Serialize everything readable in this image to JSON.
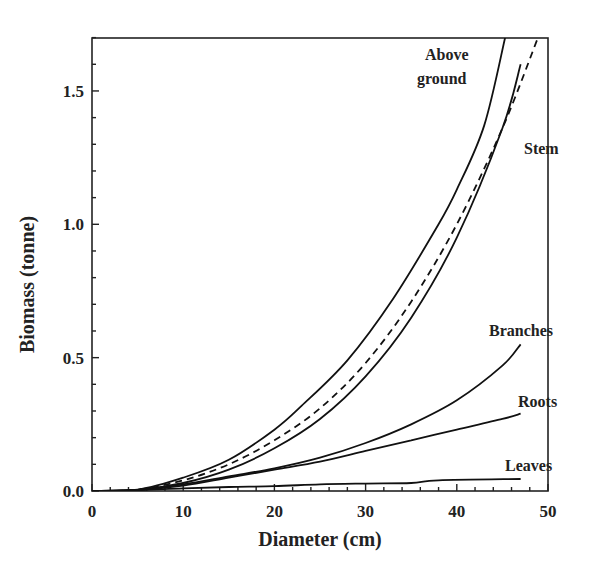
{
  "chart_data": {
    "type": "line",
    "title": "",
    "xlabel": "Diameter (cm)",
    "ylabel": "Biomass (tonne)",
    "xlim": [
      0,
      50
    ],
    "ylim": [
      0,
      1.7
    ],
    "xticks": [
      0,
      10,
      20,
      30,
      40,
      50
    ],
    "xtick_labels": [
      "0",
      "10",
      "20",
      "30",
      "40",
      "50"
    ],
    "yticks": [
      0.0,
      0.5,
      1.0,
      1.5
    ],
    "ytick_labels": [
      "0.0",
      "0.5",
      "1.0",
      "1.5"
    ],
    "grid": false,
    "legend": "inline labels",
    "series": [
      {
        "name": "Above ground",
        "style": "solid",
        "x": [
          0,
          5,
          10,
          15,
          20,
          23,
          28,
          33,
          38,
          40,
          43,
          45.3
        ],
        "y": [
          0,
          0.005,
          0.05,
          0.117,
          0.23,
          0.32,
          0.49,
          0.72,
          1.0,
          1.13,
          1.37,
          1.7
        ]
      },
      {
        "name": "Above ground (dashed)",
        "style": "dashed",
        "x": [
          0,
          5,
          10,
          15,
          20,
          25,
          30,
          35,
          40,
          45,
          48.9
        ],
        "y": [
          0,
          0.005,
          0.04,
          0.1,
          0.19,
          0.31,
          0.48,
          0.71,
          1.0,
          1.36,
          1.7
        ]
      },
      {
        "name": "Stem",
        "style": "solid",
        "x": [
          0,
          5,
          10,
          15,
          20,
          25,
          30,
          35,
          40,
          45,
          47
        ],
        "y": [
          0,
          0.004,
          0.03,
          0.08,
          0.16,
          0.27,
          0.43,
          0.65,
          0.95,
          1.36,
          1.6
        ]
      },
      {
        "name": "Branches",
        "style": "solid",
        "x": [
          0,
          5,
          10,
          15,
          20,
          25,
          30,
          35,
          40,
          45,
          47
        ],
        "y": [
          0,
          0.004,
          0.025,
          0.055,
          0.085,
          0.125,
          0.18,
          0.25,
          0.34,
          0.47,
          0.55
        ]
      },
      {
        "name": "Roots",
        "style": "solid",
        "x": [
          0,
          5,
          10,
          15,
          20,
          25,
          30,
          35,
          40,
          45,
          47
        ],
        "y": [
          0,
          0.004,
          0.02,
          0.05,
          0.08,
          0.11,
          0.15,
          0.19,
          0.23,
          0.27,
          0.29
        ]
      },
      {
        "name": "Leaves",
        "style": "solid",
        "x": [
          0,
          5,
          10,
          15,
          20,
          25,
          30,
          35,
          38,
          47
        ],
        "y": [
          0,
          0.003,
          0.01,
          0.015,
          0.018,
          0.025,
          0.028,
          0.03,
          0.04,
          0.045
        ]
      }
    ],
    "labels": [
      {
        "text": "Above",
        "x": 425,
        "y": 60
      },
      {
        "text": "ground",
        "x": 417,
        "y": 84
      },
      {
        "text": "Stem",
        "x": 524,
        "y": 154
      },
      {
        "text": "Branches",
        "x": 489,
        "y": 336
      },
      {
        "text": "Roots",
        "x": 518,
        "y": 407
      },
      {
        "text": "Leaves",
        "x": 505,
        "y": 471
      }
    ]
  }
}
